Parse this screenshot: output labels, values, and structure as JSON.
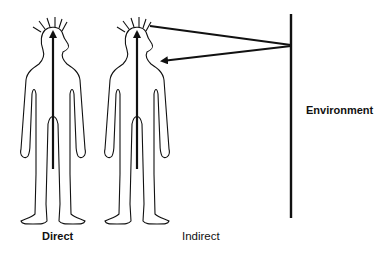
{
  "figures": [
    {
      "id": "direct",
      "label": "Direct",
      "mode": "direct-arrow-up"
    },
    {
      "id": "indirect",
      "label": "Indirect",
      "mode": "arrow-up-plus-environment-reflection"
    }
  ],
  "environment": {
    "label": "Environment"
  },
  "colors": {
    "ink": "#111111",
    "background": "#ffffff"
  }
}
